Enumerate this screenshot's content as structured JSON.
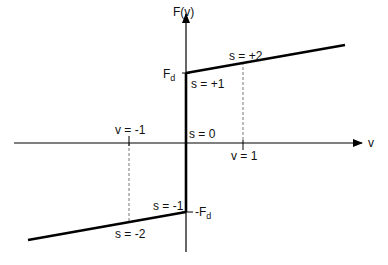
{
  "diagram": {
    "type": "friction-force-vs-velocity",
    "axes": {
      "x_label": "v",
      "y_label": "F(v)"
    },
    "ticks": {
      "v_pos": "v = 1",
      "v_neg": "v = -1",
      "fd_pos_main": "F",
      "fd_pos_sub": "d",
      "fd_neg_main": "-F",
      "fd_neg_sub": "d"
    },
    "regions": {
      "s_plus2": "s = +2",
      "s_plus1": "s = +1",
      "s_zero": "s = 0",
      "s_minus1": "s = -1",
      "s_minus2": "s = -2"
    },
    "colors": {
      "line": "#000000",
      "dashed": "#777777",
      "text": "#111111"
    }
  }
}
